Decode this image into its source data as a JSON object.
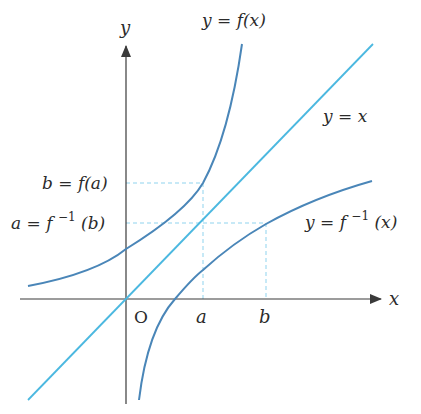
{
  "diagram": {
    "type": "inverse-function-graph",
    "colors": {
      "axis": "#3a3a3a",
      "curve": "#4a86b8",
      "identity_line": "#4bb8e0",
      "guide": "#8fd3ee",
      "text": "#2b2b2b"
    },
    "axes": {
      "x_label": "x",
      "y_label": "y",
      "origin_label": "O"
    },
    "ticks": {
      "a": "a",
      "b": "b"
    },
    "curve_labels": {
      "f": "y = f(x)",
      "f_inverse_prefix": "y = f",
      "f_inverse_sup": "−1",
      "f_inverse_suffix": "(x)",
      "identity": "y = x"
    },
    "point_labels": {
      "b_eq": "b = f(a)",
      "a_eq_prefix": "a = f",
      "a_eq_sup": "−1",
      "a_eq_suffix": "(b)"
    }
  }
}
